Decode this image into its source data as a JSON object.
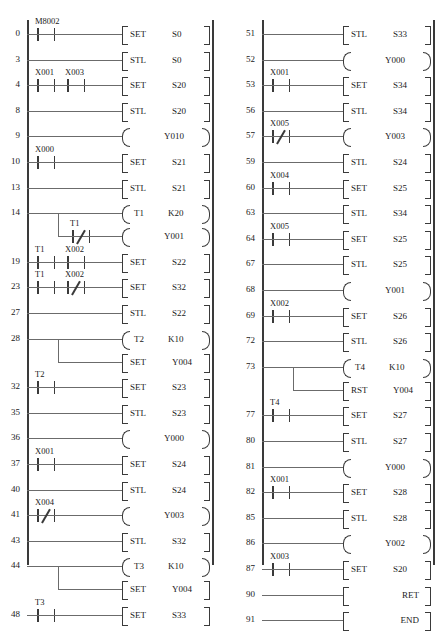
{
  "diagram": {
    "rail_color": "#3a3a3a",
    "wire_color": "#6b6b6b",
    "columns": [
      {
        "name": "left-column",
        "rungs": [
          {
            "step": "0",
            "contacts": [
              {
                "label": "M8002",
                "type": "NO"
              }
            ],
            "right": {
              "kind": "instr",
              "op": "SET",
              "arg": "S0"
            }
          },
          {
            "step": "3",
            "contacts": [],
            "right": {
              "kind": "instr",
              "op": "STL",
              "arg": "S0"
            }
          },
          {
            "step": "4",
            "contacts": [
              {
                "label": "X001",
                "type": "NO"
              },
              {
                "label": "X003",
                "type": "NO"
              }
            ],
            "right": {
              "kind": "instr",
              "op": "SET",
              "arg": "S20"
            }
          },
          {
            "step": "8",
            "contacts": [],
            "right": {
              "kind": "instr",
              "op": "STL",
              "arg": "S20"
            }
          },
          {
            "step": "9",
            "contacts": [],
            "right": {
              "kind": "coil",
              "op": "",
              "arg": "Y010"
            }
          },
          {
            "step": "10",
            "contacts": [
              {
                "label": "X000",
                "type": "NO"
              }
            ],
            "right": {
              "kind": "instr",
              "op": "SET",
              "arg": "S21"
            }
          },
          {
            "step": "13",
            "contacts": [],
            "right": {
              "kind": "instr",
              "op": "STL",
              "arg": "S21"
            }
          },
          {
            "step": "14",
            "contacts": [],
            "right": {
              "kind": "coil",
              "op": "T1",
              "arg": "K20"
            },
            "branch": {
              "contacts": [
                {
                  "label": "T1",
                  "type": "NC"
                }
              ],
              "right": {
                "kind": "coil",
                "op": "",
                "arg": "Y001"
              }
            }
          },
          {
            "step": "19",
            "contacts": [
              {
                "label": "T1",
                "type": "NO"
              },
              {
                "label": "X002",
                "type": "NO"
              }
            ],
            "right": {
              "kind": "instr",
              "op": "SET",
              "arg": "S22"
            }
          },
          {
            "step": "23",
            "contacts": [
              {
                "label": "T1",
                "type": "NO"
              },
              {
                "label": "X002",
                "type": "NC"
              }
            ],
            "right": {
              "kind": "instr",
              "op": "SET",
              "arg": "S32"
            }
          },
          {
            "step": "27",
            "contacts": [],
            "right": {
              "kind": "instr",
              "op": "STL",
              "arg": "S22"
            }
          },
          {
            "step": "28",
            "contacts": [],
            "right": {
              "kind": "coil",
              "op": "T2",
              "arg": "K10"
            },
            "branch": {
              "contacts": [],
              "right": {
                "kind": "instr",
                "op": "SET",
                "arg": "Y004"
              }
            }
          },
          {
            "step": "32",
            "contacts": [
              {
                "label": "T2",
                "type": "NO"
              }
            ],
            "right": {
              "kind": "instr",
              "op": "SET",
              "arg": "S23"
            }
          },
          {
            "step": "35",
            "contacts": [],
            "right": {
              "kind": "instr",
              "op": "STL",
              "arg": "S23"
            }
          },
          {
            "step": "36",
            "contacts": [],
            "right": {
              "kind": "coil",
              "op": "",
              "arg": "Y000"
            }
          },
          {
            "step": "37",
            "contacts": [
              {
                "label": "X001",
                "type": "NO"
              }
            ],
            "right": {
              "kind": "instr",
              "op": "SET",
              "arg": "S24"
            }
          },
          {
            "step": "40",
            "contacts": [],
            "right": {
              "kind": "instr",
              "op": "STL",
              "arg": "S24"
            }
          },
          {
            "step": "41",
            "contacts": [
              {
                "label": "X004",
                "type": "NC"
              }
            ],
            "right": {
              "kind": "coil",
              "op": "",
              "arg": "Y003"
            }
          },
          {
            "step": "43",
            "contacts": [],
            "right": {
              "kind": "instr",
              "op": "STL",
              "arg": "S32"
            }
          },
          {
            "step": "44",
            "contacts": [],
            "right": {
              "kind": "coil",
              "op": "T3",
              "arg": "K10"
            },
            "branch": {
              "contacts": [],
              "right": {
                "kind": "instr",
                "op": "SET",
                "arg": "Y004"
              }
            }
          },
          {
            "step": "48",
            "contacts": [
              {
                "label": "T3",
                "type": "NO"
              }
            ],
            "right": {
              "kind": "instr",
              "op": "SET",
              "arg": "S33"
            }
          }
        ]
      },
      {
        "name": "right-column",
        "rungs": [
          {
            "step": "51",
            "contacts": [],
            "right": {
              "kind": "instr",
              "op": "STL",
              "arg": "S33"
            }
          },
          {
            "step": "52",
            "contacts": [],
            "right": {
              "kind": "coil",
              "op": "",
              "arg": "Y000"
            }
          },
          {
            "step": "53",
            "contacts": [
              {
                "label": "X001",
                "type": "NO"
              }
            ],
            "right": {
              "kind": "instr",
              "op": "SET",
              "arg": "S34"
            }
          },
          {
            "step": "56",
            "contacts": [],
            "right": {
              "kind": "instr",
              "op": "STL",
              "arg": "S34"
            }
          },
          {
            "step": "57",
            "contacts": [
              {
                "label": "X005",
                "type": "NC"
              }
            ],
            "right": {
              "kind": "coil",
              "op": "",
              "arg": "Y003"
            }
          },
          {
            "step": "59",
            "contacts": [],
            "right": {
              "kind": "instr",
              "op": "STL",
              "arg": "S24"
            }
          },
          {
            "step": "60",
            "contacts": [
              {
                "label": "X004",
                "type": "NO"
              }
            ],
            "right": {
              "kind": "instr",
              "op": "SET",
              "arg": "S25"
            }
          },
          {
            "step": "63",
            "contacts": [],
            "right": {
              "kind": "instr",
              "op": "STL",
              "arg": "S34"
            }
          },
          {
            "step": "64",
            "contacts": [
              {
                "label": "X005",
                "type": "NO"
              }
            ],
            "right": {
              "kind": "instr",
              "op": "SET",
              "arg": "S25"
            }
          },
          {
            "step": "67",
            "contacts": [],
            "right": {
              "kind": "instr",
              "op": "STL",
              "arg": "S25"
            }
          },
          {
            "step": "68",
            "contacts": [],
            "right": {
              "kind": "coil",
              "op": "",
              "arg": "Y001"
            }
          },
          {
            "step": "69",
            "contacts": [
              {
                "label": "X002",
                "type": "NO"
              }
            ],
            "right": {
              "kind": "instr",
              "op": "SET",
              "arg": "S26"
            }
          },
          {
            "step": "72",
            "contacts": [],
            "right": {
              "kind": "instr",
              "op": "STL",
              "arg": "S26"
            }
          },
          {
            "step": "73",
            "contacts": [],
            "right": {
              "kind": "coil",
              "op": "T4",
              "arg": "K10"
            },
            "branch": {
              "contacts": [],
              "right": {
                "kind": "instr",
                "op": "RST",
                "arg": "Y004"
              }
            }
          },
          {
            "step": "77",
            "contacts": [
              {
                "label": "T4",
                "type": "NO"
              }
            ],
            "right": {
              "kind": "instr",
              "op": "SET",
              "arg": "S27"
            }
          },
          {
            "step": "80",
            "contacts": [],
            "right": {
              "kind": "instr",
              "op": "STL",
              "arg": "S27"
            }
          },
          {
            "step": "81",
            "contacts": [],
            "right": {
              "kind": "coil",
              "op": "",
              "arg": "Y000"
            }
          },
          {
            "step": "82",
            "contacts": [
              {
                "label": "X001",
                "type": "NO"
              }
            ],
            "right": {
              "kind": "instr",
              "op": "SET",
              "arg": "S28"
            }
          },
          {
            "step": "85",
            "contacts": [],
            "right": {
              "kind": "instr",
              "op": "STL",
              "arg": "S28"
            }
          },
          {
            "step": "86",
            "contacts": [],
            "right": {
              "kind": "coil",
              "op": "",
              "arg": "Y002"
            }
          },
          {
            "step": "87",
            "contacts": [
              {
                "label": "X003",
                "type": "NO"
              }
            ],
            "right": {
              "kind": "instr",
              "op": "SET",
              "arg": "S20"
            }
          },
          {
            "step": "90",
            "contacts": [],
            "right": {
              "kind": "instr",
              "op": "RET",
              "arg": "",
              "align": "right"
            }
          },
          {
            "step": "91",
            "contacts": [],
            "right": {
              "kind": "instr",
              "op": "END",
              "arg": "",
              "align": "right"
            }
          }
        ]
      }
    ]
  }
}
